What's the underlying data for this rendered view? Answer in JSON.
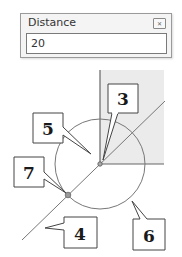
{
  "dialog": {
    "title": "Distance",
    "close_icon": "close-icon",
    "close_glyph": "✕",
    "input_value": "20"
  },
  "diagram": {
    "shaded_color": "#ebebeb",
    "line_color": "#777777",
    "callouts": [
      {
        "id": "3",
        "label": "3"
      },
      {
        "id": "5",
        "label": "5"
      },
      {
        "id": "7",
        "label": "7"
      },
      {
        "id": "4",
        "label": "4"
      },
      {
        "id": "6",
        "label": "6"
      }
    ]
  }
}
